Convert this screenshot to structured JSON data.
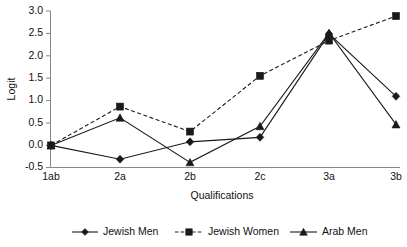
{
  "chart_data": {
    "type": "line",
    "title": "",
    "xlabel": "Qualifications",
    "ylabel": "Logit",
    "categories": [
      "1ab",
      "2a",
      "2b",
      "2c",
      "3a",
      "3b"
    ],
    "yticks": [
      "-0.5",
      "0.0",
      "0.5",
      "1.0",
      "1.5",
      "2.0",
      "2.5",
      "3.0"
    ],
    "ylim": [
      -0.5,
      3.0
    ],
    "grid": false,
    "legend_position": "bottom",
    "series": [
      {
        "name": "Jewish Men",
        "marker": "diamond",
        "linestyle": "solid",
        "color": "#1a1a1a",
        "values": [
          0.0,
          -0.31,
          0.08,
          0.18,
          2.5,
          1.1
        ]
      },
      {
        "name": "Jewish Women",
        "marker": "square",
        "linestyle": "dashed",
        "color": "#1a1a1a",
        "values": [
          0.0,
          0.87,
          0.31,
          1.56,
          2.35,
          2.9
        ]
      },
      {
        "name": "Arab Men",
        "marker": "triangle",
        "linestyle": "solid",
        "color": "#1a1a1a",
        "values": [
          0.0,
          0.62,
          -0.38,
          0.43,
          2.52,
          0.47
        ]
      }
    ]
  },
  "axes": {
    "y_title": "Logit",
    "x_title": "Qualifications"
  },
  "legend": {
    "items": [
      {
        "label": "Jewish Men"
      },
      {
        "label": "Jewish Women"
      },
      {
        "label": "Arab Men"
      }
    ]
  }
}
